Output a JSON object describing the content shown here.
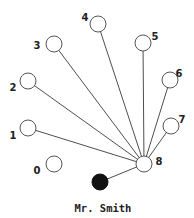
{
  "diagram": {
    "type": "network",
    "hub": "8",
    "nodes": [
      {
        "id": "0",
        "label": "0",
        "filled": false
      },
      {
        "id": "1",
        "label": "1",
        "filled": false
      },
      {
        "id": "2",
        "label": "2",
        "filled": false
      },
      {
        "id": "3",
        "label": "3",
        "filled": false
      },
      {
        "id": "4",
        "label": "4",
        "filled": false
      },
      {
        "id": "5",
        "label": "5",
        "filled": false
      },
      {
        "id": "6",
        "label": "6",
        "filled": false
      },
      {
        "id": "7",
        "label": "7",
        "filled": false
      },
      {
        "id": "8",
        "label": "8",
        "filled": false
      },
      {
        "id": "smith",
        "label": "Mr. Smith",
        "filled": true
      }
    ],
    "edges": [
      [
        "1",
        "8"
      ],
      [
        "2",
        "8"
      ],
      [
        "3",
        "8"
      ],
      [
        "4",
        "8"
      ],
      [
        "5",
        "8"
      ],
      [
        "6",
        "8"
      ],
      [
        "7",
        "8"
      ],
      [
        "smith",
        "8"
      ]
    ],
    "colors": {
      "edge": "#3a3a3a",
      "node_outline": "#555555",
      "filled_node": "#111111"
    }
  }
}
